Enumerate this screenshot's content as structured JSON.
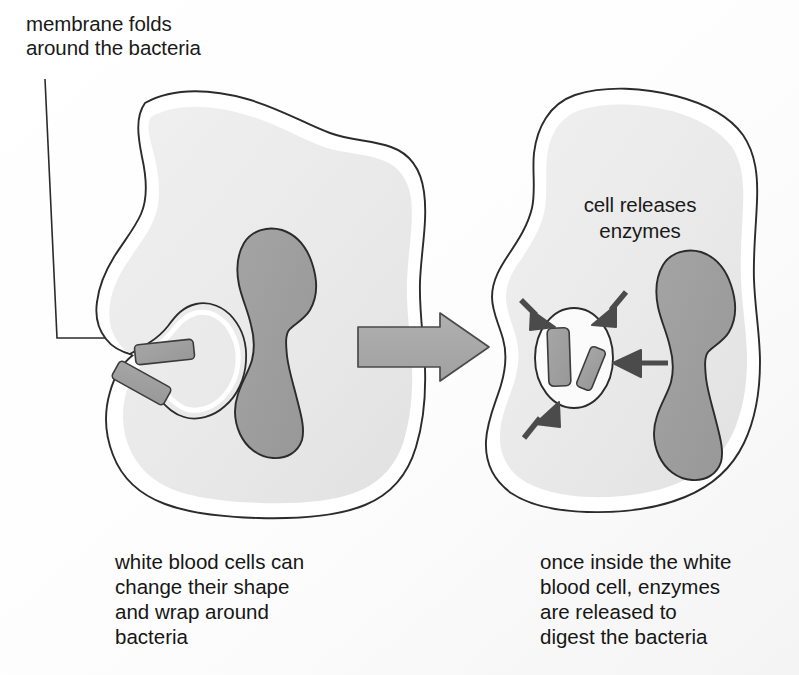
{
  "figure": {
    "background_color": "#ffffff"
  },
  "palette": {
    "outline": "#2b2b2b",
    "membrane_band": "#ffffff",
    "cytoplasm": "#ebebeb",
    "nucleus_fill": "#9d9d9d",
    "bacteria_fill": "#9e9e9e",
    "vacuole_fill": "#fbfbfb",
    "big_arrow_fill": "#a8a8a8",
    "enzyme_arrow_fill": "#4b4b4b",
    "text_color": "#1a1a1a"
  },
  "labels": {
    "callout": {
      "line1": "membrane folds",
      "line2": "around the bacteria"
    },
    "enzyme_label": {
      "line1": "cell releases",
      "line2": "enzymes"
    }
  },
  "captions": {
    "left": {
      "line1": "white blood cells can",
      "line2": "change their shape",
      "line3": "and wrap around",
      "line4": "bacteria"
    },
    "right": {
      "line1": "once inside the white",
      "line2": "blood cell, enzymes",
      "line3": "are released to",
      "line4": "digest the bacteria"
    }
  },
  "stages": {
    "left_cell": {
      "name": "white blood cell engulfing bacteria",
      "bacteria_count": 2,
      "nucleus_shape": "bilobed",
      "has_membrane_cleft": true
    },
    "right_cell": {
      "name": "white blood cell with bacteria in vacuole",
      "bacteria_count": 2,
      "nucleus_shape": "bilobed",
      "vacuole_present": true,
      "enzyme_arrow_count": 4
    }
  },
  "process_arrow": {
    "direction": "right",
    "meaning": "next stage"
  }
}
